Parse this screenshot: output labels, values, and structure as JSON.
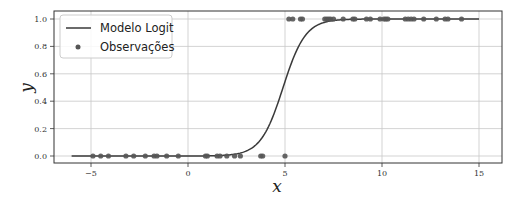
{
  "chart_data": {
    "type": "scatter",
    "title": "",
    "xlabel": "x",
    "ylabel": "y",
    "xlim": [
      -7,
      16.2
    ],
    "ylim": [
      -0.05,
      1.05
    ],
    "xticks": [
      -5,
      0,
      5,
      10,
      15
    ],
    "xtick_labels": [
      "−5",
      "0",
      "5",
      "10",
      "15"
    ],
    "yticks": [
      0.0,
      0.2,
      0.4,
      0.6,
      0.8,
      1.0
    ],
    "ytick_labels": [
      "0.0",
      "0.2",
      "0.4",
      "0.6",
      "0.8",
      "1.0"
    ],
    "grid": true,
    "legend_position": "upper left",
    "legend": [
      "Modelo Logit",
      "Observações"
    ],
    "series": [
      {
        "name": "Modelo Logit",
        "kind": "line",
        "function": "logistic",
        "x_range": [
          -6,
          15
        ],
        "midpoint": 4.9,
        "steepness": 1.73,
        "color": "#3a3a3a"
      },
      {
        "name": "Observações",
        "kind": "scatter",
        "color": "#555555",
        "points_y0": [
          -4.9,
          -4.5,
          -4.1,
          -3.2,
          -2.8,
          -2.2,
          -1.75,
          -1.6,
          -1.1,
          -0.5,
          0.9,
          1.0,
          1.5,
          1.65,
          2.0,
          2.4,
          2.7,
          3.75,
          3.85,
          5.0
        ],
        "points_y1": [
          5.2,
          5.4,
          5.8,
          5.9,
          7.05,
          7.15,
          7.25,
          7.35,
          7.5,
          8.0,
          8.5,
          8.6,
          9.2,
          9.4,
          9.9,
          10.1,
          10.2,
          10.3,
          11.2,
          11.35,
          11.5,
          11.65,
          12.15,
          12.8,
          13.25,
          13.4,
          14.1
        ]
      }
    ]
  }
}
